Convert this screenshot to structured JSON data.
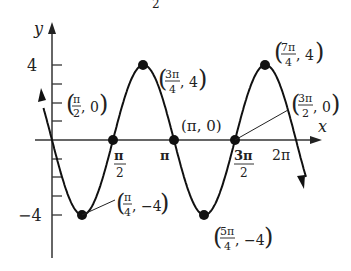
{
  "chart_data": {
    "type": "line",
    "title": "",
    "function": "y = -4 sin(2x)",
    "xlabel": "x",
    "ylabel": "y",
    "x_ticks": [
      {
        "value": 1.5708,
        "label_num": "π",
        "label_den": "2"
      },
      {
        "value": 3.1416,
        "label": "π"
      },
      {
        "value": 4.7124,
        "label_num": "3π",
        "label_den": "2"
      },
      {
        "value": 6.2832,
        "label": "2π"
      }
    ],
    "y_ticks": [
      {
        "value": 4,
        "label": "4"
      },
      {
        "value": 3,
        "label": ""
      },
      {
        "value": 2,
        "label": ""
      },
      {
        "value": 1,
        "label": ""
      },
      {
        "value": -1,
        "label": ""
      },
      {
        "value": -2,
        "label": ""
      },
      {
        "value": -3,
        "label": ""
      },
      {
        "value": -4,
        "label": "−4"
      }
    ],
    "xlim": [
      -0.3,
      6.6
    ],
    "ylim": [
      -5,
      5
    ],
    "grid": false,
    "series": [
      {
        "name": "y = -4 sin 2x",
        "x": [
          0,
          0.7854,
          1.5708,
          2.3562,
          3.1416,
          3.927,
          4.7124,
          5.4978,
          6.2832
        ],
        "y": [
          0,
          -4,
          0,
          4,
          0,
          -4,
          0,
          4,
          0
        ]
      }
    ],
    "annotations": [
      {
        "point": [
          0.7854,
          -4
        ],
        "num": "π",
        "den": "4",
        "y": "−4"
      },
      {
        "point": [
          1.5708,
          0
        ],
        "num": "π",
        "den": "2",
        "y": "0"
      },
      {
        "point": [
          2.3562,
          4
        ],
        "num": "3π",
        "den": "4",
        "y": "4"
      },
      {
        "point": [
          3.1416,
          0
        ],
        "text": "(π, 0)"
      },
      {
        "point": [
          3.927,
          -4
        ],
        "num": "5π",
        "den": "4",
        "y": "−4"
      },
      {
        "point": [
          4.7124,
          0
        ],
        "num": "3π",
        "den": "2",
        "y": "0"
      },
      {
        "point": [
          5.4978,
          4
        ],
        "num": "7π",
        "den": "4",
        "y": "4"
      }
    ]
  },
  "labels": {
    "y_axis": "y",
    "x_axis": "x",
    "y4": "4",
    "yneg4": "−4",
    "pi": "π",
    "two": "2",
    "four": "4",
    "three_pi": "3π",
    "five_pi": "5π",
    "seven_pi": "7π",
    "two_pi": "2π",
    "comma_zero": ", 0",
    "comma_four": ", 4",
    "comma_neg4": ", −4",
    "pi_zero": "(π, 0)",
    "top_fragment": "2"
  }
}
